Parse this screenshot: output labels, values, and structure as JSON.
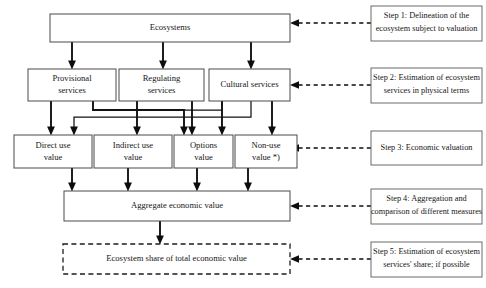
{
  "diagram": {
    "colors": {
      "box_border": "#4a4a4a",
      "step_border": "#6b6b6b",
      "connector": "#121212",
      "text": "#161616",
      "background": "#ffffff"
    },
    "nodes": {
      "ecosystems": "Ecosystems",
      "provisional_services": [
        "Provisional",
        "services"
      ],
      "regulating_services": [
        "Regulating",
        "services"
      ],
      "cultural_services": "Cultural services",
      "direct_use_value": [
        "Direct use",
        "value"
      ],
      "indirect_use_value": [
        "Indirect use",
        "value"
      ],
      "options_value": [
        "Options",
        "value"
      ],
      "non_use_value": [
        "Non-use",
        "value *)"
      ],
      "aggregate_economic_value": "Aggregate economic value",
      "ecosystem_share": "Ecosystem share of total economic value"
    },
    "steps": [
      {
        "id": "step-1",
        "lines": [
          "Step 1: Delineation of the",
          "ecosystem subject to valuation"
        ]
      },
      {
        "id": "step-2",
        "lines": [
          "Step 2: Estimation of ecosystem",
          "services in physical terms"
        ]
      },
      {
        "id": "step-3",
        "lines": [
          "Step 3: Economic valuation"
        ]
      },
      {
        "id": "step-4",
        "lines": [
          "Step 4: Aggregation and",
          "comparison of different measures"
        ]
      },
      {
        "id": "step-5",
        "lines": [
          "Step 5: Estimation of ecosystem",
          "services' share; if possible"
        ]
      }
    ]
  }
}
